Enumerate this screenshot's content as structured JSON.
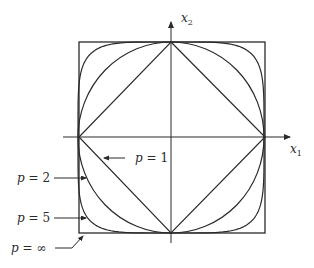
{
  "figure": {
    "axes": {
      "x_label": "x",
      "x_subscript": "1",
      "y_label": "x",
      "y_subscript": "2"
    },
    "curves": [
      {
        "name": "p=1",
        "label_var": "p",
        "label_eq": " = ",
        "label_val": "1",
        "shape": "diamond"
      },
      {
        "name": "p=2",
        "label_var": "p",
        "label_eq": " = ",
        "label_val": "2",
        "shape": "circle"
      },
      {
        "name": "p=5",
        "label_var": "p",
        "label_eq": " = ",
        "label_val": "5",
        "shape": "superellipse"
      },
      {
        "name": "p=inf",
        "label_var": "p",
        "label_eq": " = ",
        "label_val": "∞",
        "shape": "square"
      }
    ],
    "colors": {
      "stroke": "#2a2a2a",
      "background": "#ffffff"
    }
  }
}
